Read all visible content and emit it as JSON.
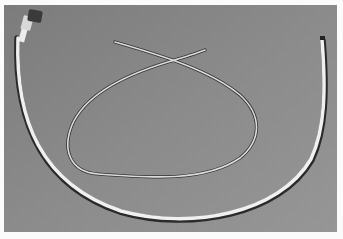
{
  "image": {
    "description": "Grayscale photograph of two medical catheters/tubes on a gray background",
    "subjects": [
      {
        "name": "long catheter",
        "description": "large U-shaped white tube with luer connector hub at top-left end"
      },
      {
        "name": "looped catheter",
        "description": "thinner tube forming a loop with crossing ends at top center"
      }
    ],
    "colors": {
      "border": "#fbfbfb",
      "background": "#8a8a8a",
      "background_dark": "#7a7a7a",
      "tube_light": "#f2f2f2",
      "tube_shadow": "#2a2a2a",
      "connector": "#3a3a3a"
    }
  }
}
